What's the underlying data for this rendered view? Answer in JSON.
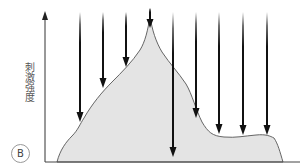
{
  "figure": {
    "panel_label": "B",
    "y_axis_label": "刺激强度",
    "colors": {
      "fill": "#e4e4e4",
      "outline": "#555555",
      "axis": "#333333",
      "arrow": "#111111"
    },
    "arrows": [
      {
        "x": 80,
        "tip_y": 122
      },
      {
        "x": 103,
        "tip_y": 88
      },
      {
        "x": 126,
        "tip_y": 67
      },
      {
        "x": 150,
        "tip_y": 28
      },
      {
        "x": 173,
        "tip_y": 157
      },
      {
        "x": 196,
        "tip_y": 118
      },
      {
        "x": 219,
        "tip_y": 134
      },
      {
        "x": 243,
        "tip_y": 135
      },
      {
        "x": 267,
        "tip_y": 135
      }
    ]
  }
}
